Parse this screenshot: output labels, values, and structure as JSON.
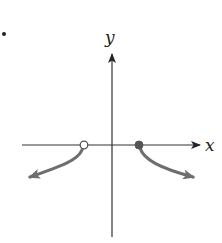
{
  "figure": {
    "type": "function-graph",
    "marker_bullet": "•",
    "axes": {
      "x_label": "x",
      "y_label": "y",
      "axis_color": "#333333"
    },
    "curve_color": "#6e6e6e",
    "branches": [
      {
        "name": "left-branch",
        "start_point": {
          "x": 84,
          "y": 145,
          "endpoint": "open"
        },
        "end_arrow_direction": "down-left"
      },
      {
        "name": "right-branch",
        "start_point": {
          "x": 139,
          "y": 145,
          "endpoint": "closed"
        },
        "end_arrow_direction": "down-right"
      }
    ]
  }
}
